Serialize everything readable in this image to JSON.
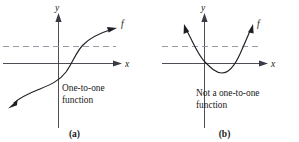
{
  "figure": {
    "panels": [
      {
        "id": "a",
        "tag": "(a)",
        "caption": "One-to-one\nfunction",
        "y_axis_label": "y",
        "x_axis_label": "x",
        "curve_label": "f",
        "curve_type": "increasing-s-curve",
        "horizontal_test_line": "dashed",
        "horizontal_test_intersections": 1
      },
      {
        "id": "b",
        "tag": "(b)",
        "caption": "Not a one-to-one\nfunction",
        "y_axis_label": "y",
        "x_axis_label": "x",
        "curve_label": "f",
        "curve_type": "parabola-upward",
        "horizontal_test_line": "dashed",
        "horizontal_test_intersections": 2
      }
    ],
    "colors": {
      "background": "#ffffff",
      "axis": "#3a3a44",
      "curve": "#1e1e24",
      "dashed_guide": "#8e8e9a",
      "text": "#1a1a1a"
    }
  }
}
